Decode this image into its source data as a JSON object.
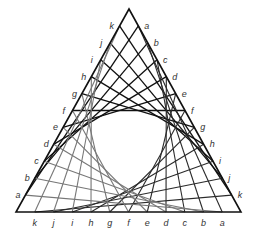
{
  "figure": {
    "triangle": {
      "apex": [
        129,
        9
      ],
      "bottom_left": [
        16,
        212
      ],
      "bottom_right": [
        241,
        212
      ],
      "stroke": "#111111"
    },
    "point_letters": [
      "a",
      "b",
      "c",
      "d",
      "e",
      "f",
      "g",
      "h",
      "i",
      "j",
      "k"
    ],
    "edges": {
      "left": {
        "from": "bottom_left",
        "to": "apex",
        "label_order": "a at bottom, k at top"
      },
      "right": {
        "from": "apex",
        "to": "bottom_right",
        "label_order": "a at top, k at bottom"
      },
      "bottom": {
        "from": "bottom_right",
        "to": "bottom_left",
        "label_order": "a at right, k at left"
      }
    },
    "line_families": [
      {
        "name": "left-to-right",
        "from_edge": "left",
        "to_edge": "right",
        "color": "#111111",
        "width": 1.3
      },
      {
        "name": "right-to-bottom",
        "from_edge": "right",
        "to_edge": "bottom",
        "color": "#2a2a2a",
        "width": 1.1
      },
      {
        "name": "bottom-to-left",
        "from_edge": "bottom",
        "to_edge": "left",
        "color": "#777777",
        "width": 1.1
      }
    ],
    "label_offsets": {
      "left": [
        -10,
        3
      ],
      "right": [
        6,
        3
      ],
      "bottom": [
        0,
        14
      ]
    }
  }
}
